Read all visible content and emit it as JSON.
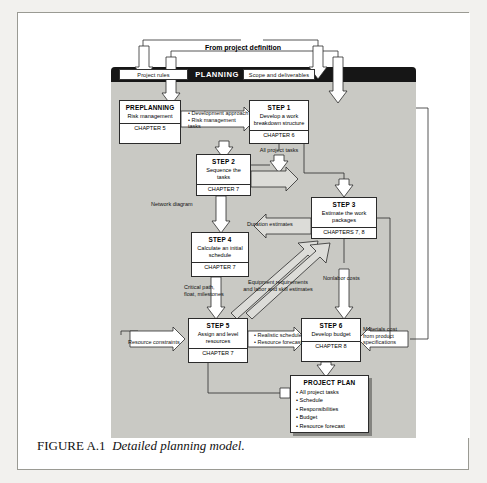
{
  "figure": {
    "caption_number": "FIGURE A.1",
    "caption_text": "Detailed planning model."
  },
  "diagram": {
    "top_caption": "From project definition",
    "panel": {
      "title": "PLANNING",
      "tabs": [
        {
          "label": "Project rules"
        },
        {
          "label": "Scope and deliverables"
        }
      ]
    },
    "boxes": {
      "preplanning": {
        "title": "PREPLANNING",
        "desc": "Risk management",
        "chapter": "CHAPTER 5"
      },
      "step1": {
        "title": "STEP 1",
        "desc": "Develop a work breakdown structure",
        "chapter": "CHAPTER 6"
      },
      "step2": {
        "title": "STEP 2",
        "desc": "Sequence the tasks",
        "chapter": "CHAPTER 7"
      },
      "step3": {
        "title": "STEP 3",
        "desc": "Estimate the work packages",
        "chapter": "CHAPTERS 7, 8"
      },
      "step4": {
        "title": "STEP 4",
        "desc": "Calculate an initial schedule",
        "chapter": "CHAPTER 7"
      },
      "step5": {
        "title": "STEP 5",
        "desc": "Assign and level resources",
        "chapter": "CHAPTER 7"
      },
      "step6": {
        "title": "STEP 6",
        "desc": "Develop budget",
        "chapter": "CHAPTER 8"
      }
    },
    "project_plan": {
      "title": "PROJECT PLAN",
      "items": [
        "All project tasks",
        "Schedule",
        "Responsibilities",
        "Budget",
        "Resource forecast"
      ]
    },
    "flow_labels": {
      "development_approach": "• Development approach\n• Risk management tasks",
      "all_project_tasks": "All project tasks",
      "network_diagram": "Network diagram",
      "duration_estimates": "Duration estimates",
      "critical_path": "Critical path,\nfloat, milestones",
      "equipment_requirements": "Equipment requirements\nand labor and skill estimates",
      "nonlabor_costs": "Nonlabor costs",
      "resource_constraints": "Resource constraints",
      "realistic_schedule": "• Realistic schedule\n• Resource forecast",
      "materials_cost": "Materials cost\nfrom product\nspecifications"
    }
  },
  "colors": {
    "panel_grey": "#c9c9c4",
    "panel_header": "#161616",
    "page_background": "#f2f1ee",
    "arrow_fill": "#d8d8d4"
  }
}
